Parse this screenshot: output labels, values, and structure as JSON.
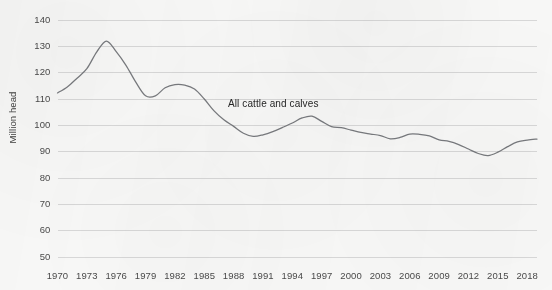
{
  "chart_data": {
    "type": "line",
    "title": "",
    "xlabel": "",
    "ylabel": "Million head",
    "xlim": [
      1970,
      2019
    ],
    "ylim": [
      50,
      140
    ],
    "grid": true,
    "legend_position": "inline-annotation",
    "annotations": [
      {
        "text": "All cattle and calves",
        "x": 1992,
        "y": 105
      }
    ],
    "ytick_labels": [
      "140",
      "130",
      "120",
      "110",
      "100",
      "90",
      "80",
      "70",
      "60",
      "50"
    ],
    "yticks": [
      140,
      130,
      120,
      110,
      100,
      90,
      80,
      70,
      60,
      50
    ],
    "xtick_labels": [
      "1970",
      "1973",
      "1976",
      "1979",
      "1982",
      "1985",
      "1988",
      "1991",
      "1994",
      "1997",
      "2000",
      "2003",
      "2006",
      "2009",
      "2012",
      "2015",
      "2018"
    ],
    "xticks": [
      1970,
      1973,
      1976,
      1979,
      1982,
      1985,
      1988,
      1991,
      1994,
      1997,
      2000,
      2003,
      2006,
      2009,
      2012,
      2015,
      2018
    ],
    "series": [
      {
        "name": "All cattle and calves",
        "color": "#6c6f73",
        "x": [
          1970,
          1971,
          1972,
          1973,
          1974,
          1975,
          1976,
          1977,
          1978,
          1979,
          1980,
          1981,
          1982,
          1983,
          1984,
          1985,
          1986,
          1987,
          1988,
          1989,
          1990,
          1991,
          1992,
          1993,
          1994,
          1995,
          1996,
          1997,
          1998,
          1999,
          2000,
          2001,
          2002,
          2003,
          2004,
          2005,
          2006,
          2007,
          2008,
          2009,
          2010,
          2011,
          2012,
          2013,
          2014,
          2015,
          2016,
          2017,
          2018,
          2019
        ],
        "values": [
          112.3,
          114.6,
          117.9,
          121.5,
          127.8,
          132.0,
          128.0,
          122.8,
          116.4,
          111.2,
          111.2,
          114.3,
          115.5,
          115.3,
          113.8,
          110.0,
          105.5,
          102.1,
          99.6,
          97.0,
          95.8,
          96.4,
          97.6,
          99.2,
          100.9,
          102.8,
          103.5,
          101.5,
          99.5,
          99.1,
          98.2,
          97.3,
          96.7,
          96.1,
          94.9,
          95.4,
          96.7,
          96.6,
          96.0,
          94.5,
          93.9,
          92.7,
          91.0,
          89.3,
          88.5,
          89.8,
          91.9,
          93.7,
          94.4,
          94.8
        ]
      }
    ]
  },
  "axis": {
    "y_title": "Million head"
  }
}
